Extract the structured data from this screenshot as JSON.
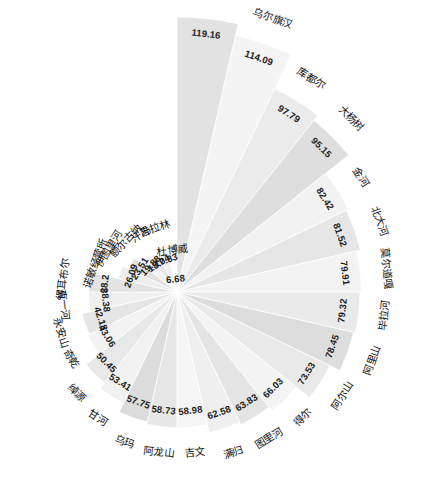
{
  "chart_data": {
    "type": "pie",
    "variant": "polar-rose",
    "title": "",
    "subtitle": "",
    "xlabel": "",
    "ylabel": "",
    "grid": false,
    "legend": false,
    "legend_position": "none",
    "value_range": [
      0,
      119.16
    ],
    "start_angle_deg": -90,
    "direction": "clockwise",
    "sector_count": 24,
    "categories": [
      "根河",
      "乌尔旗汉",
      "库都尔",
      "大杨树",
      "金河",
      "北大河",
      "莫尔道嘎",
      "毕拉河",
      "阿里山",
      "阿尔山",
      "得尔",
      "图里河",
      "满归",
      "吉文",
      "阿龙山",
      "乌玛",
      "甘河",
      "绰源",
      "奇乾",
      "永安山",
      "克一河",
      "得耳布尔",
      "诺敏经营所",
      "伊图里河",
      "额尔古纳",
      "汗马",
      "吉拉林",
      "杜博威"
    ],
    "categories_used": [
      "根河",
      "乌尔旗汉",
      "库都尔",
      "大杨树",
      "金河",
      "北大河",
      "莫尔道嘎",
      "毕拉河",
      "阿里山",
      "阿尔山",
      "得尔",
      "图里河",
      "满归",
      "吉文",
      "阿龙山",
      "乌玛",
      "甘河",
      "绰源",
      "奇乾",
      "永安山",
      "克一河",
      "得耳布尔",
      "诺敏经营所",
      "伊图里河",
      "额尔古纳",
      "汗马",
      "吉拉林",
      "杜博威"
    ],
    "values": [
      119.16,
      114.09,
      97.79,
      95.15,
      82.42,
      81.52,
      79.91,
      79.32,
      78.45,
      73.53,
      66.03,
      63.83,
      62.58,
      58.98,
      58.73,
      57.75,
      53.41,
      50.45,
      43.06,
      42.18,
      38.38,
      38.2,
      26.09,
      23.51,
      19.88,
      18.04,
      17.83,
      6.68
    ],
    "slices": [
      {
        "label": "根河",
        "value": 119.16,
        "value_text": "119.16",
        "fill": "#e2e2e2"
      },
      {
        "label": "乌尔旗汉",
        "value": 114.09,
        "value_text": "114.09",
        "fill": "#f4f4f4"
      },
      {
        "label": "库都尔",
        "value": 97.79,
        "value_text": "97.79",
        "fill": "#ebebeb"
      },
      {
        "label": "大杨树",
        "value": 95.15,
        "value_text": "95.15",
        "fill": "#dedede"
      },
      {
        "label": "金河",
        "value": 82.42,
        "value_text": "82.42",
        "fill": "#f2f2f2"
      },
      {
        "label": "北大河",
        "value": 81.52,
        "value_text": "81.52",
        "fill": "#e6e6e6"
      },
      {
        "label": "莫尔道嘎",
        "value": 79.91,
        "value_text": "79.91",
        "fill": "#f3f3f3"
      },
      {
        "label": "毕拉河",
        "value": 79.32,
        "value_text": "79.32",
        "fill": "#eaeaea"
      },
      {
        "label": "阿里山",
        "value": 78.45,
        "value_text": "78.45",
        "fill": "#dddddd"
      },
      {
        "label": "阿尔山",
        "value": 73.53,
        "value_text": "73.53",
        "fill": "#e9e9e9"
      },
      {
        "label": "得尔",
        "value": 66.03,
        "value_text": "66.03",
        "fill": "#f4f4f4"
      },
      {
        "label": "图里河",
        "value": 63.83,
        "value_text": "63.83",
        "fill": "#e4e4e4"
      },
      {
        "label": "满归",
        "value": 62.58,
        "value_text": "62.58",
        "fill": "#efefef"
      },
      {
        "label": "吉文",
        "value": 58.98,
        "value_text": "58.98",
        "fill": "#f5f5f5"
      },
      {
        "label": "阿龙山",
        "value": 58.73,
        "value_text": "58.73",
        "fill": "#e7e7e7"
      },
      {
        "label": "乌玛",
        "value": 57.75,
        "value_text": "57.75",
        "fill": "#dcdcdc"
      },
      {
        "label": "甘河",
        "value": 53.41,
        "value_text": "53.41",
        "fill": "#f1f1f1"
      },
      {
        "label": "绰源",
        "value": 50.45,
        "value_text": "50.45",
        "fill": "#e8e8e8"
      },
      {
        "label": "奇乾",
        "value": 43.06,
        "value_text": "43.06",
        "fill": "#f3f3f3"
      },
      {
        "label": "永安山",
        "value": 42.18,
        "value_text": "42.18",
        "fill": "#e5e5e5"
      },
      {
        "label": "克一河",
        "value": 38.38,
        "value_text": "38.38",
        "fill": "#f0f0f0"
      },
      {
        "label": "得耳布尔",
        "value": 38.2,
        "value_text": "38.2",
        "fill": "#e3e3e3"
      },
      {
        "label": "诺敏经营所",
        "value": 26.09,
        "value_text": "26.09",
        "fill": "#ededed"
      },
      {
        "label": "伊图里河",
        "value": 23.51,
        "value_text": "23.51",
        "fill": "#e1e1e1"
      },
      {
        "label": "额尔古纳",
        "value": 19.88,
        "value_text": "19.88",
        "fill": "#f2f2f2"
      },
      {
        "label": "汗马",
        "value": 18.04,
        "value_text": "18.04",
        "fill": "#e6e6e6"
      },
      {
        "label": "吉拉林",
        "value": 17.83,
        "value_text": "17.83",
        "fill": "#efefef"
      },
      {
        "label": "杜博威",
        "value": 6.68,
        "value_text": "6.68",
        "fill": "#e9e9e9"
      }
    ],
    "colors": {
      "background": "#ffffff",
      "sector_light": "#f4f4f4",
      "sector_dark": "#dcdcdc",
      "sector_stroke": "#ffffff",
      "text": "#1a1a1a"
    }
  },
  "geometry": {
    "center_x": 177,
    "center_y": 292,
    "max_radius": 275,
    "min_radius": 0
  }
}
